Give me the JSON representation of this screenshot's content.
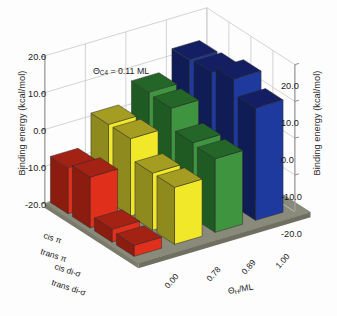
{
  "figure": {
    "background_color": "#fdfdfd",
    "annotation": "ΘC4 = 0.11 ML",
    "annotation_parts": {
      "theta": "Θ",
      "sub": "C4",
      "rest": " = 0.11 ML"
    }
  },
  "axes": {
    "left_title": "Binding energy (kcal/mol)",
    "right_title": "Binding energy (kcal/mol)",
    "depth_title": "ΘH/ML",
    "depth_title_parts": {
      "theta": "Θ",
      "sub": "H",
      "rest": "/ML"
    },
    "z_ticks": [
      "20.0",
      "10.0",
      "0.0",
      "-10.0",
      "-20.0"
    ],
    "z_tick_values": [
      20.0,
      10.0,
      0.0,
      -10.0,
      -20.0
    ],
    "z_range": [
      -20.0,
      20.0
    ],
    "category_labels": [
      "cis π",
      "trans π",
      "cis di-σ",
      "trans di-σ"
    ],
    "depth_tick_labels": [
      "0.00",
      "0.78",
      "0.89",
      "1.00"
    ],
    "grid": "on",
    "floor_color": "#8a8a7a"
  },
  "chart_data": {
    "type": "bar",
    "title": "",
    "subtitle": "",
    "xlabel": "ΘH/ML",
    "ylabel": "Binding energy (kcal/mol)",
    "zlabel": "Binding energy (kcal/mol)",
    "annotation": "ΘC4 = 0.11 ML",
    "projection": "3d",
    "ylim": [
      -20.0,
      20.0
    ],
    "grid": true,
    "legend_position": "none",
    "categories": [
      "cis π",
      "trans π",
      "cis di-σ",
      "trans di-σ"
    ],
    "depth_categories": [
      "0.00",
      "0.78",
      "0.89",
      "1.00"
    ],
    "series": [
      {
        "name": "0.00",
        "color": "#e0301b",
        "side_color": "#8d1c10",
        "top_color": "#a32214",
        "values": [
          -7.5,
          -6.2,
          -16.5,
          -17.0
        ]
      },
      {
        "name": "0.78",
        "color": "#f2e82a",
        "side_color": "#8f8a1e",
        "top_color": "#a59d22",
        "values": [
          1.0,
          1.0,
          -4.5,
          -4.5
        ]
      },
      {
        "name": "0.89",
        "color": "#3f9440",
        "side_color": "#1f5a22",
        "top_color": "#246628",
        "values": [
          6.5,
          6.0,
          0.5,
          0.0
        ]
      },
      {
        "name": "1.00",
        "color": "#1f3a9e",
        "side_color": "#101c55",
        "top_color": "#131f62",
        "values": [
          12.0,
          12.5,
          14.5,
          10.5
        ]
      }
    ]
  }
}
